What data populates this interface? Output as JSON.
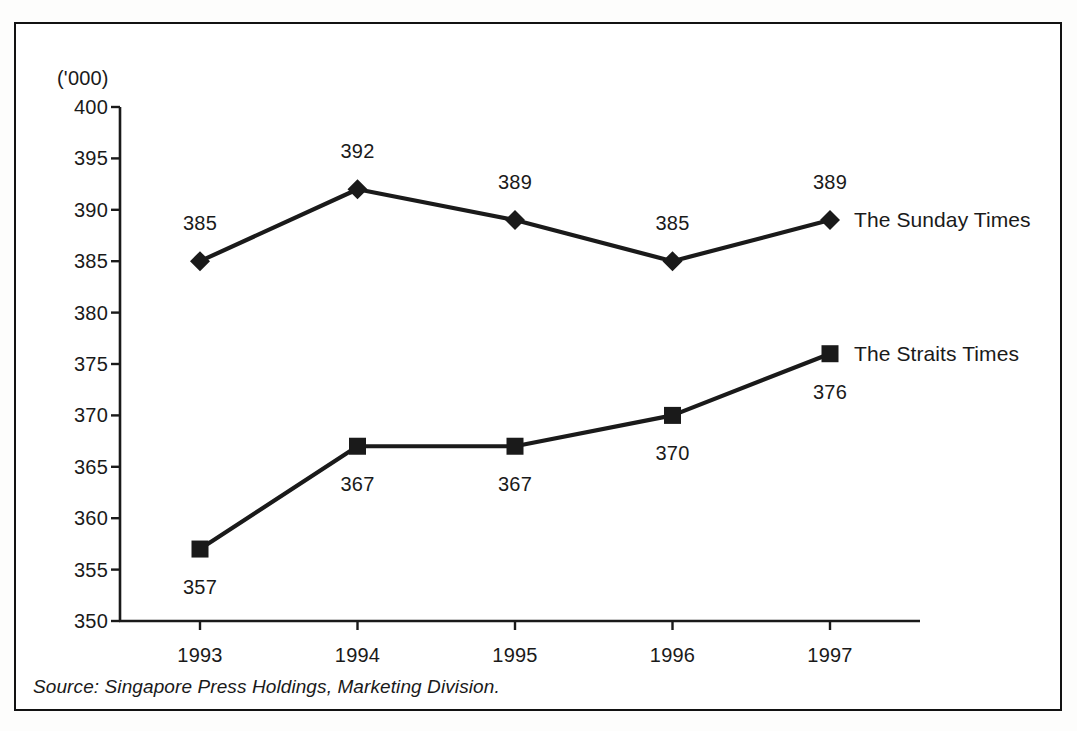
{
  "figure": {
    "unit_label": "('000)",
    "source_note": "Source: Singapore Press Holdings, Marketing Division.",
    "border_color": "#121212",
    "ink_color": "#1a1a1a",
    "background_color": "#ffffff"
  },
  "chart_data": {
    "type": "line",
    "title": "",
    "subtitle": "",
    "xlabel": "",
    "ylabel": "('000)",
    "categories": [
      "1993",
      "1994",
      "1995",
      "1996",
      "1997"
    ],
    "x_tick_labels": [
      "1993",
      "1994",
      "1995",
      "1996",
      "1997"
    ],
    "y_tick_labels": [
      "400",
      "395",
      "390",
      "385",
      "380",
      "375",
      "370",
      "365",
      "360",
      "355",
      "350"
    ],
    "y_tick_values": [
      400,
      395,
      390,
      385,
      380,
      375,
      370,
      365,
      360,
      355,
      350
    ],
    "ylim": [
      350,
      400
    ],
    "grid": false,
    "legend_position": "inline-right",
    "series": [
      {
        "name": "The Sunday Times",
        "marker": "diamond",
        "label_position": "above",
        "values": [
          385,
          392,
          389,
          385,
          389
        ],
        "point_labels": [
          "385",
          "392",
          "389",
          "385",
          "389"
        ]
      },
      {
        "name": "The Straits Times",
        "marker": "square",
        "label_position": "below",
        "values": [
          357,
          367,
          367,
          370,
          376
        ],
        "point_labels": [
          "357",
          "367",
          "367",
          "370",
          "376"
        ]
      }
    ]
  }
}
